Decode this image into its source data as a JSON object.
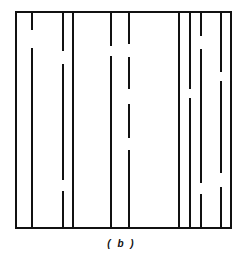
{
  "figure": {
    "caption": "( b )",
    "colors": {
      "line": "#111111",
      "background": "#ffffff"
    },
    "frame": {
      "x1": 16,
      "y1": 12,
      "x2": 231,
      "y2": 228,
      "stroke_width": 2
    },
    "lines": [
      {
        "x": 32,
        "gaps": [
          [
            30,
            48
          ]
        ]
      },
      {
        "x": 63,
        "gaps": [
          [
            51,
            64
          ],
          [
            180,
            191
          ]
        ]
      },
      {
        "x": 73,
        "gaps": []
      },
      {
        "x": 111,
        "gaps": [
          [
            46,
            56
          ]
        ]
      },
      {
        "x": 129,
        "gaps": [
          [
            44,
            57
          ],
          [
            89,
            104
          ],
          [
            138,
            150
          ]
        ]
      },
      {
        "x": 179,
        "gaps": []
      },
      {
        "x": 190,
        "gaps": [
          [
            89,
            98
          ]
        ]
      },
      {
        "x": 201,
        "gaps": [
          [
            36,
            49
          ],
          [
            183,
            194
          ]
        ]
      },
      {
        "x": 221,
        "gaps": [
          [
            72,
            81
          ],
          [
            173,
            187
          ]
        ]
      }
    ]
  }
}
